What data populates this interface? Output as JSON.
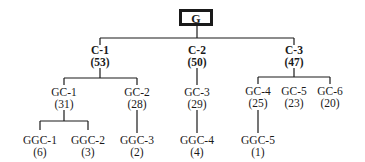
{
  "diagram": {
    "type": "tree",
    "root": {
      "label": "G"
    },
    "level1": [
      {
        "label": "C-1",
        "count": "(53)"
      },
      {
        "label": "C-2",
        "count": "(50)"
      },
      {
        "label": "C-3",
        "count": "(47)"
      }
    ],
    "level2": [
      {
        "label": "GC-1",
        "count": "(31)",
        "parent": "C-1"
      },
      {
        "label": "GC-2",
        "count": "(28)",
        "parent": "C-1"
      },
      {
        "label": "GC-3",
        "count": "(29)",
        "parent": "C-2"
      },
      {
        "label": "GC-4",
        "count": "(25)",
        "parent": "C-3"
      },
      {
        "label": "GC-5",
        "count": "(23)",
        "parent": "C-3"
      },
      {
        "label": "GC-6",
        "count": "(20)",
        "parent": "C-3"
      }
    ],
    "level3": [
      {
        "label": "GGC-1",
        "count": "(6)",
        "parent": "GC-1"
      },
      {
        "label": "GGC-2",
        "count": "(3)",
        "parent": "GC-1"
      },
      {
        "label": "GGC-3",
        "count": "(2)",
        "parent": "GC-2"
      },
      {
        "label": "GGC-4",
        "count": "(4)",
        "parent": "GC-3"
      },
      {
        "label": "GGC-5",
        "count": "(1)",
        "parent": "GC-4"
      }
    ]
  }
}
